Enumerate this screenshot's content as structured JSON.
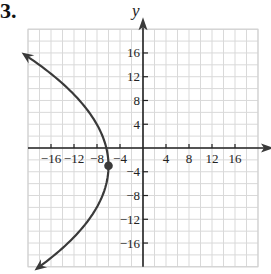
{
  "problem": {
    "number_label": "3."
  },
  "chart_data": {
    "type": "line",
    "title": "",
    "xlabel": "x",
    "ylabel": "y",
    "xlim": [
      -20,
      20
    ],
    "ylim": [
      -20,
      20
    ],
    "grid": true,
    "grid_step": 2,
    "x_ticks": [
      -16,
      -12,
      -8,
      -4,
      4,
      8,
      12,
      16
    ],
    "x_tick_labels": [
      "−16",
      "−12",
      "−8",
      "−4",
      "4",
      "8",
      "12",
      "16"
    ],
    "y_ticks": [
      16,
      12,
      8,
      4,
      -4,
      -8,
      -12,
      -16
    ],
    "y_tick_labels": [
      "16",
      "12",
      "8",
      "4",
      "−4",
      "−8",
      "−12",
      "−16"
    ],
    "series": [
      {
        "name": "parabola",
        "description": "Parabola opening left with vertex at (-6, -3); arrows at both ends",
        "equation": "(y + 3)^2 = -24(x + 6)",
        "vertex": {
          "x": -6,
          "y": -3
        },
        "y_range": [
          -20,
          15.5
        ],
        "points": [
          {
            "x": -20,
            "y": 15.3
          },
          {
            "x": -16,
            "y": 12.5
          },
          {
            "x": -12,
            "y": 9.0
          },
          {
            "x": -8,
            "y": 3.9
          },
          {
            "x": -6,
            "y": -3
          },
          {
            "x": -8,
            "y": -9.9
          },
          {
            "x": -12,
            "y": -15.0
          },
          {
            "x": -16,
            "y": -18.5
          },
          {
            "x": -18,
            "y": -20
          }
        ]
      }
    ],
    "annotations": [
      {
        "type": "point",
        "x": -6,
        "y": -3,
        "label": "vertex"
      }
    ],
    "colors": {
      "curve": "#3a3a3a",
      "axis": "#222222",
      "grid": "#d9d9d9"
    }
  }
}
